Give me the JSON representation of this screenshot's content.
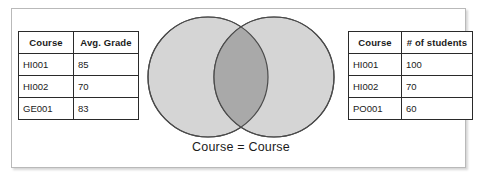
{
  "diagram": {
    "title_caption": "Course = Course",
    "colors": {
      "circle_fill": "#d5d5d5",
      "overlap_fill": "#a9a9a9",
      "circle_stroke": "#4a4a4a",
      "table_border": "#2a2a2a",
      "frame_border": "#b9b9b9",
      "text": "#1b1b1b",
      "background": "#ffffff"
    },
    "left_circle_name": "left-set-circle",
    "right_circle_name": "right-set-circle",
    "overlap_name": "set-intersection-region"
  },
  "left_table": {
    "headers": [
      "Course",
      "Avg. Grade"
    ],
    "rows": [
      {
        "course": "HI001",
        "value": "85"
      },
      {
        "course": "HI002",
        "value": "70"
      },
      {
        "course": "GE001",
        "value": "83"
      }
    ]
  },
  "right_table": {
    "headers": [
      "Course",
      "# of students"
    ],
    "rows": [
      {
        "course": "HI001",
        "value": "100"
      },
      {
        "course": "HI002",
        "value": "70"
      },
      {
        "course": "PO001",
        "value": "60"
      }
    ]
  }
}
